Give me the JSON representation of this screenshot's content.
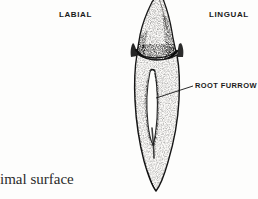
{
  "figure": {
    "background_color": "#fdfdfc",
    "ink_color": "#1a1a1a",
    "width": 258,
    "height": 199
  },
  "labels": {
    "labial": "LABIAL",
    "lingual": "LINGUAL",
    "root_furrow": "ROOT FURROW"
  },
  "caption": {
    "proximal_surface_text": "imal surface"
  },
  "illustration": {
    "subject": "tooth-proximal-view",
    "parts": [
      {
        "name": "crown",
        "description": "pointed cusp leaning lingually, stippled enamel"
      },
      {
        "name": "cervical-line",
        "description": "cementoenamel junction, dark curved band"
      },
      {
        "name": "root",
        "description": "long tapering root ending in rounded apex"
      },
      {
        "name": "root-furrow",
        "description": "dark narrow vertical developmental groove on root surface"
      }
    ],
    "leader_line": {
      "from_x": 156,
      "from_y": 98,
      "to_x": 193,
      "to_y": 86
    }
  }
}
